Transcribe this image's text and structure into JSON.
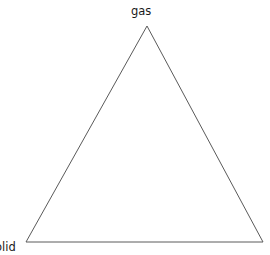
{
  "diagram": {
    "type": "triangle-diagram",
    "title": "",
    "background_color": "#ffffff",
    "stroke_color": "#5a5a5a",
    "stroke_width": 1,
    "text_color": "#1a1a1a",
    "shape": {
      "name": "triangle",
      "vertices": {
        "apex": {
          "x": 147,
          "y": 26
        },
        "bottom_left": {
          "x": 26,
          "y": 242
        },
        "bottom_right": {
          "x": 263,
          "y": 242
        }
      },
      "points_attr": "147,26 26,242 263,242"
    },
    "labels": [
      {
        "id": "gas",
        "text": "gas",
        "position": "apex",
        "x": 131,
        "y": 5,
        "clipped": false
      },
      {
        "id": "solid",
        "text": "solid",
        "position": "bottom-left",
        "x": -11,
        "y": 241,
        "clipped": true,
        "visible_text": "olid"
      }
    ]
  },
  "chart_data": {
    "type": "diagram",
    "title": "",
    "categories": [
      "gas",
      "solid"
    ],
    "annotations": [
      "gas",
      "solid"
    ]
  }
}
